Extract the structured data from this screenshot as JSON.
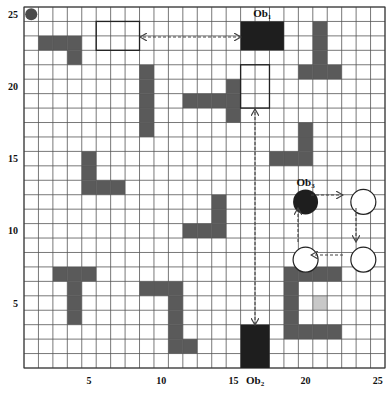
{
  "grid": {
    "cols": 25,
    "rows": 25,
    "origin_px": [
      24,
      7
    ],
    "cell_px": 14.44,
    "line_color": "#555555",
    "background": "#ffffff"
  },
  "axes": {
    "x_ticks": [
      {
        "label": "5",
        "col": 5
      },
      {
        "label": "10",
        "col": 10
      },
      {
        "label": "15",
        "col": 15
      },
      {
        "label": "20",
        "col": 20
      },
      {
        "label": "25",
        "col": 25
      }
    ],
    "y_ticks": [
      {
        "label": "5",
        "row": 5
      },
      {
        "label": "10",
        "row": 10
      },
      {
        "label": "15",
        "row": 15
      },
      {
        "label": "20",
        "row": 20
      },
      {
        "label": "25",
        "row": 25
      }
    ]
  },
  "colors": {
    "static_obstacle": "#5a5a5a",
    "dynamic_obstacle": "#1e1e1e",
    "light_cell": "#c8c8c8",
    "start_marker": "#4a4a4a",
    "arrow": "#444444"
  },
  "start_marker": {
    "col": 1,
    "row": 25
  },
  "static_obstacles": [
    {
      "name": "top-left-l",
      "cells": [
        [
          2,
          23
        ],
        [
          3,
          23
        ],
        [
          4,
          23
        ],
        [
          4,
          22
        ]
      ]
    },
    {
      "name": "col9-bar",
      "cells": [
        [
          9,
          21
        ],
        [
          9,
          20
        ],
        [
          9,
          19
        ],
        [
          9,
          18
        ],
        [
          9,
          17
        ]
      ]
    },
    {
      "name": "center-t",
      "cells": [
        [
          12,
          19
        ],
        [
          13,
          19
        ],
        [
          14,
          19
        ],
        [
          15,
          19
        ],
        [
          15,
          20
        ],
        [
          15,
          18
        ]
      ]
    },
    {
      "name": "top-right-l",
      "cells": [
        [
          21,
          24
        ],
        [
          21,
          23
        ],
        [
          21,
          22
        ],
        [
          20,
          21
        ],
        [
          21,
          21
        ],
        [
          22,
          21
        ]
      ]
    },
    {
      "name": "right-l",
      "cells": [
        [
          20,
          17
        ],
        [
          20,
          16
        ],
        [
          18,
          15
        ],
        [
          19,
          15
        ],
        [
          20,
          15
        ]
      ]
    },
    {
      "name": "left-l",
      "cells": [
        [
          5,
          15
        ],
        [
          5,
          14
        ],
        [
          5,
          13
        ],
        [
          6,
          13
        ],
        [
          7,
          13
        ]
      ]
    },
    {
      "name": "mid-l",
      "cells": [
        [
          14,
          12
        ],
        [
          14,
          11
        ],
        [
          12,
          10
        ],
        [
          13,
          10
        ],
        [
          14,
          10
        ]
      ]
    },
    {
      "name": "lower-left-t",
      "cells": [
        [
          3,
          7
        ],
        [
          4,
          7
        ],
        [
          5,
          7
        ],
        [
          4,
          6
        ],
        [
          4,
          5
        ],
        [
          4,
          4
        ]
      ]
    },
    {
      "name": "lower-mid-l",
      "cells": [
        [
          9,
          6
        ],
        [
          10,
          6
        ],
        [
          11,
          6
        ],
        [
          11,
          5
        ],
        [
          11,
          4
        ],
        [
          11,
          3
        ],
        [
          11,
          2
        ],
        [
          12,
          2
        ]
      ]
    },
    {
      "name": "right-c",
      "cells": [
        [
          19,
          7
        ],
        [
          20,
          7
        ],
        [
          21,
          7
        ],
        [
          22,
          7
        ],
        [
          19,
          6
        ],
        [
          19,
          5
        ],
        [
          19,
          4
        ],
        [
          19,
          3
        ],
        [
          20,
          3
        ],
        [
          21,
          3
        ],
        [
          22,
          3
        ]
      ]
    }
  ],
  "light_cells": [
    [
      21,
      5
    ]
  ],
  "dynamic_obstacles": [
    {
      "id": "ob1",
      "label": "Ob",
      "sub": "1",
      "shape": "rect",
      "col": 16,
      "row": 24,
      "w": 3,
      "h": 2
    },
    {
      "id": "ob2",
      "label": "Ob",
      "sub": "2",
      "shape": "rect",
      "col": 16,
      "row": 3,
      "w": 2,
      "h": 3
    },
    {
      "id": "ob3",
      "label": "Ob",
      "sub": "3",
      "shape": "circle",
      "cx_col": 20,
      "cy_row": 12
    }
  ],
  "ghost_positions": [
    {
      "id": "ob1-target",
      "shape": "rect",
      "col": 6,
      "row": 24,
      "w": 3,
      "h": 2
    },
    {
      "id": "ob2-target",
      "shape": "rect",
      "col": 16,
      "row": 21,
      "w": 2,
      "h": 3
    },
    {
      "id": "ob3-step1",
      "shape": "circle",
      "cx_col": 24,
      "cy_row": 12
    },
    {
      "id": "ob3-step2",
      "shape": "circle",
      "cx_col": 24,
      "cy_row": 8
    },
    {
      "id": "ob3-step3",
      "shape": "circle",
      "cx_col": 20,
      "cy_row": 8
    }
  ],
  "trajectories": [
    {
      "id": "ob1-path",
      "from": [
        241,
        37
      ],
      "to": [
        140,
        37
      ],
      "heads": "both"
    },
    {
      "id": "ob2-path",
      "from": [
        255,
        325
      ],
      "to": [
        255,
        109
      ],
      "heads": "both"
    },
    {
      "id": "ob3-path-1",
      "from": [
        311,
        195
      ],
      "to": [
        343,
        195
      ],
      "heads": "end"
    },
    {
      "id": "ob3-path-2",
      "from": [
        356,
        208
      ],
      "to": [
        356,
        242
      ],
      "heads": "end"
    },
    {
      "id": "ob3-path-3",
      "from": [
        343,
        255
      ],
      "to": [
        311,
        255
      ],
      "heads": "end"
    },
    {
      "id": "ob3-path-4",
      "from": [
        298,
        242
      ],
      "to": [
        298,
        208
      ],
      "heads": "end"
    }
  ]
}
